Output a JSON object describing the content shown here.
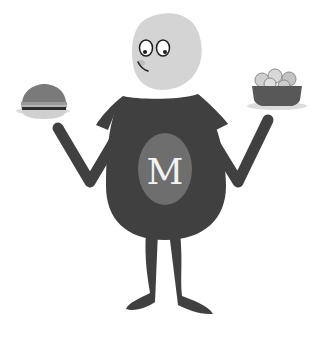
{
  "illustration": {
    "description": "Cartoon character holding a burger and a salad bowl",
    "chest_letter": "M",
    "colors": {
      "background": "#ffffff",
      "head": "#d4d4d4",
      "body": "#404040",
      "chest_oval": "#6e6e6e",
      "letter": "#f2f2f2",
      "burger_bun": "#7a7a7a",
      "burger_bottom": "#d0d0d0",
      "bowl": "#585858",
      "plate": "#dcdcdc",
      "salad": "#cfcfcf",
      "outline": "#1e1e1e"
    }
  }
}
